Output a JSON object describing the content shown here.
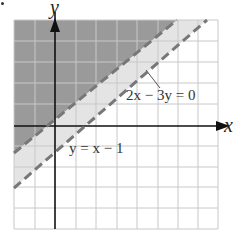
{
  "figure": {
    "axis_labels": {
      "x": "x",
      "y": "y"
    },
    "equations": [
      {
        "id": "line_a",
        "label": "2x − 3y = 0",
        "style": "dashed"
      },
      {
        "id": "line_b",
        "label": "y = x − 1",
        "style": "dashed"
      }
    ],
    "grid": {
      "columns": 10,
      "rows": 10
    },
    "colors": {
      "dark_region": "#9a9a9a",
      "light_region": "#e4e4e4",
      "dashed_line": "#777777",
      "grid_line": "#c8c8c8",
      "axis": "#111111"
    }
  }
}
